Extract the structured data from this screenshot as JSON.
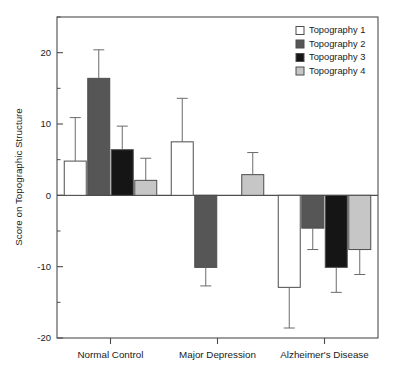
{
  "chart_data": {
    "type": "bar",
    "title": "",
    "xlabel": "",
    "ylabel": "Score on Topographic Structure",
    "ylim": [
      -20,
      25
    ],
    "yticks": [
      20,
      10,
      0,
      -10,
      -20
    ],
    "ytick_labels": [
      "20",
      "10",
      "0",
      "-10",
      "-20"
    ],
    "yminor_ticks": [
      25,
      15,
      5,
      -5,
      -15
    ],
    "grid": false,
    "legend_position": "top-right",
    "categories": [
      "Normal Control",
      "Major Depression",
      "Alzheimer's Disease"
    ],
    "series": [
      {
        "name": "Topography 1",
        "color": "#ffffff",
        "values": [
          4.8,
          7.5,
          -12.9
        ],
        "errors": [
          6.1,
          6.1,
          5.7
        ]
      },
      {
        "name": "Topography 2",
        "color": "#565656",
        "values": [
          16.4,
          -10.1,
          -4.6
        ],
        "errors": [
          4.0,
          2.6,
          3.0
        ]
      },
      {
        "name": "Topography 3",
        "color": "#151515",
        "values": [
          6.4,
          null,
          -10.1
        ],
        "errors": [
          3.3,
          null,
          3.5
        ]
      },
      {
        "name": "Topography 4",
        "color": "#c6c6c6",
        "values": [
          2.1,
          2.9,
          -7.6
        ],
        "errors": [
          3.1,
          3.1,
          3.5
        ]
      }
    ]
  },
  "legend": {
    "items": [
      {
        "label": "Topography 1",
        "swatch": "#ffffff"
      },
      {
        "label": "Topography 2",
        "swatch": "#565656"
      },
      {
        "label": "Topography 3",
        "swatch": "#151515"
      },
      {
        "label": "Topography 4",
        "swatch": "#c6c6c6"
      }
    ]
  },
  "axes": {
    "y_title": "Score on Topographic Structure",
    "y_tick_labels": [
      "20",
      "10",
      "0",
      "-10",
      "-20"
    ],
    "x_tick_labels": [
      "Normal Control",
      "Major Depression",
      "Alzheimer's Disease"
    ]
  }
}
